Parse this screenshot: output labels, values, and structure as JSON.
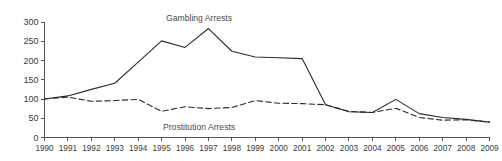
{
  "chart_data": {
    "type": "line",
    "title": "",
    "xlabel": "",
    "ylabel": "",
    "categories": [
      "1990",
      "1991",
      "1992",
      "1993",
      "1994",
      "1995",
      "1996",
      "1997",
      "1998",
      "1999",
      "2000",
      "2001",
      "2002",
      "2003",
      "2004",
      "2005",
      "2006",
      "2007",
      "2008",
      "2009"
    ],
    "x": [
      1990,
      1991,
      1992,
      1993,
      1994,
      1995,
      1996,
      1997,
      1998,
      1999,
      2000,
      2001,
      2002,
      2003,
      2004,
      2005,
      2006,
      2007,
      2008,
      2009
    ],
    "xlim": [
      1990,
      2009
    ],
    "ylim": [
      0,
      300
    ],
    "yticks": [
      0,
      50,
      100,
      150,
      200,
      250,
      300
    ],
    "ytick_labels": [
      "0",
      "50",
      "100",
      "150",
      "200",
      "250",
      "300"
    ],
    "grid": false,
    "legend_position": "inline-annotation",
    "series": [
      {
        "name": "Gambling Arrests",
        "style": "solid",
        "color": "#2b2b2b",
        "annotation_label": "Gambling Arrests",
        "values": [
          100,
          108,
          125,
          141,
          196,
          251,
          234,
          283,
          224,
          209,
          207,
          205,
          85,
          67,
          65,
          99,
          62,
          52,
          47,
          40
        ]
      },
      {
        "name": "Prostitution Arrests",
        "style": "dashed",
        "color": "#2b2b2b",
        "annotation_label": "Prostitution Arrests",
        "values": [
          100,
          105,
          94,
          96,
          99,
          68,
          80,
          75,
          78,
          96,
          89,
          88,
          85,
          68,
          65,
          76,
          52,
          45,
          46,
          40
        ]
      }
    ],
    "annotations": [
      {
        "text": "Gambling Arrests",
        "x": 1996.6,
        "y": 311
      },
      {
        "text": "Prostitution Arrests",
        "x": 1996.6,
        "y": 28
      }
    ]
  }
}
